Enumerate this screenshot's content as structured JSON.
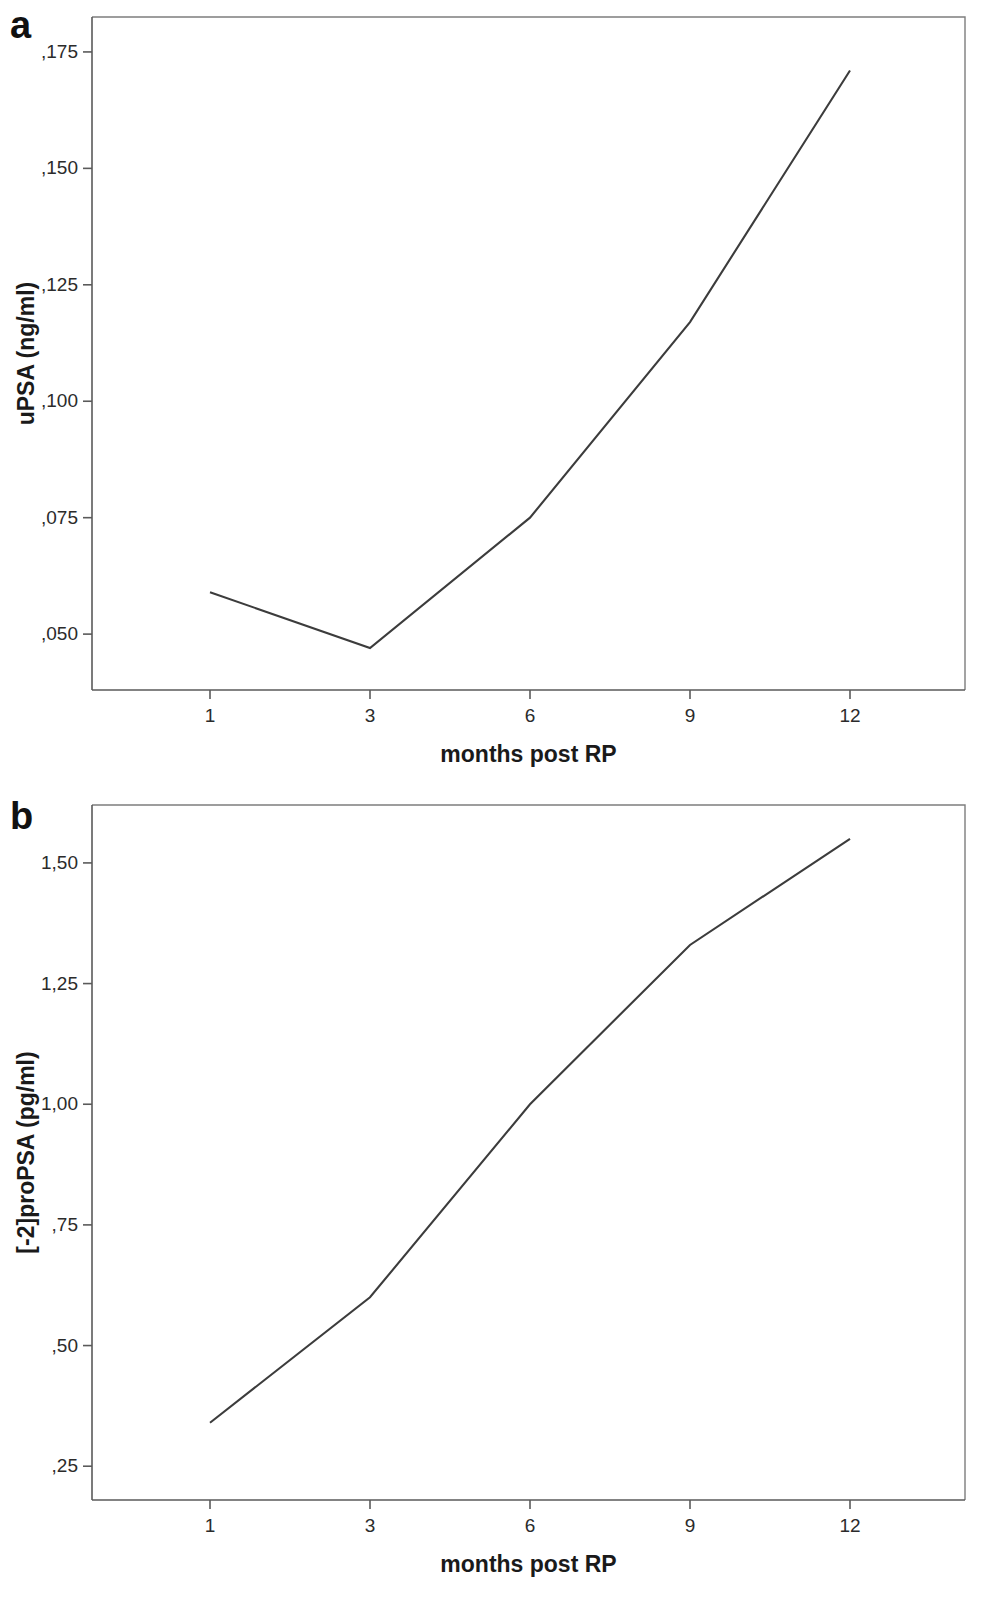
{
  "figure": {
    "panel_a_label": "a",
    "panel_b_label": "b"
  },
  "chart_data": [
    {
      "type": "line",
      "panel": "a",
      "title": "",
      "xlabel": "months post RP",
      "ylabel": "uPSA (ng/ml)",
      "categories": [
        "1",
        "3",
        "6",
        "9",
        "12"
      ],
      "x": [
        1,
        3,
        6,
        9,
        12
      ],
      "values": [
        0.059,
        0.047,
        0.075,
        0.117,
        0.171
      ],
      "ytick_labels": [
        ",175",
        ",150",
        ",125",
        ",100",
        ",075",
        ",050"
      ],
      "ytick_values": [
        0.175,
        0.15,
        0.125,
        0.1,
        0.075,
        0.05
      ],
      "xtick_labels": [
        "1",
        "3",
        "6",
        "9",
        "12"
      ],
      "ylim": [
        0.038,
        0.1825
      ],
      "grid": false,
      "legend": "none",
      "decimal_separator": ","
    },
    {
      "type": "line",
      "panel": "b",
      "title": "",
      "xlabel": "months post RP",
      "ylabel": "[-2]proPSA (pg/ml)",
      "categories": [
        "1",
        "3",
        "6",
        "9",
        "12"
      ],
      "x": [
        1,
        3,
        6,
        9,
        12
      ],
      "values": [
        0.34,
        0.6,
        1.0,
        1.33,
        1.55
      ],
      "ytick_labels": [
        "1,50",
        "1,25",
        "1,00",
        ",75",
        ",50",
        ",25"
      ],
      "ytick_values": [
        1.5,
        1.25,
        1.0,
        0.75,
        0.5,
        0.25
      ],
      "xtick_labels": [
        "1",
        "3",
        "6",
        "9",
        "12"
      ],
      "ylim": [
        0.18,
        1.62
      ],
      "grid": false,
      "legend": "none",
      "decimal_separator": ","
    }
  ],
  "panel_a": {
    "label": "a",
    "y_axis_title": "uPSA (ng/ml)",
    "x_axis_title": "months post RP",
    "y_ticks": [
      ",175",
      ",150",
      ",125",
      ",100",
      ",075",
      ",050"
    ],
    "x_ticks": [
      "1",
      "3",
      "6",
      "9",
      "12"
    ]
  },
  "panel_b": {
    "label": "b",
    "y_axis_title": "[-2]proPSA (pg/ml)",
    "x_axis_title": "months post RP",
    "y_ticks": [
      "1,50",
      "1,25",
      "1,00",
      ",75",
      ",50",
      ",25"
    ],
    "x_ticks": [
      "1",
      "3",
      "6",
      "9",
      "12"
    ]
  }
}
